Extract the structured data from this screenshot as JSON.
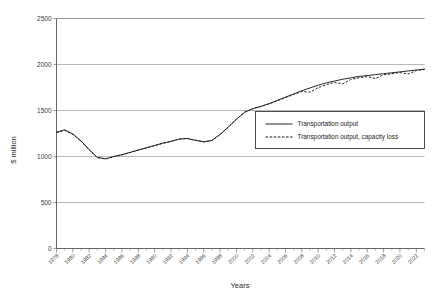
{
  "chart_data": {
    "type": "line",
    "title": "",
    "xlabel": "Years",
    "ylabel": "$ million",
    "ylim": [
      0,
      2500
    ],
    "xlim": [
      1978,
      2023
    ],
    "grid": true,
    "legend_position": "center-right",
    "y_ticks": [
      "0",
      "500",
      "1000",
      "1500",
      "2000",
      "2500"
    ],
    "y_tick_values": [
      0,
      500,
      1000,
      1500,
      2000,
      2500
    ],
    "x_tick_labels": [
      "1978",
      "1980",
      "1982",
      "1984",
      "1986",
      "1988",
      "1990",
      "1992",
      "1994",
      "1996",
      "1998",
      "2000",
      "2002",
      "2004",
      "2006",
      "2008",
      "2010",
      "2012",
      "2014",
      "2016",
      "2018",
      "2020",
      "2022"
    ],
    "x_tick_values": [
      1978,
      1980,
      1982,
      1984,
      1986,
      1988,
      1990,
      1992,
      1994,
      1996,
      1998,
      2000,
      2002,
      2004,
      2006,
      2008,
      2010,
      2012,
      2014,
      2016,
      2018,
      2020,
      2022
    ],
    "x": [
      1978,
      1979,
      1980,
      1981,
      1982,
      1983,
      1984,
      1985,
      1986,
      1987,
      1988,
      1989,
      1990,
      1991,
      1992,
      1993,
      1994,
      1995,
      1996,
      1997,
      1998,
      1999,
      2000,
      2001,
      2002,
      2003,
      2004,
      2005,
      2006,
      2007,
      2008,
      2009,
      2010,
      2011,
      2012,
      2013,
      2014,
      2015,
      2016,
      2017,
      2018,
      2019,
      2020,
      2021,
      2022,
      2023
    ],
    "series": [
      {
        "name": "Transportation output",
        "style": "solid",
        "values": [
          1265,
          1290,
          1245,
          1170,
          1075,
          990,
          975,
          1000,
          1020,
          1045,
          1070,
          1095,
          1120,
          1145,
          1165,
          1190,
          1195,
          1175,
          1160,
          1175,
          1240,
          1320,
          1405,
          1480,
          1520,
          1545,
          1575,
          1610,
          1645,
          1680,
          1715,
          1745,
          1775,
          1800,
          1820,
          1840,
          1855,
          1870,
          1880,
          1890,
          1900,
          1910,
          1920,
          1930,
          1940,
          1950
        ]
      },
      {
        "name": "Transportation output, capacity loss",
        "style": "dashed",
        "values": [
          1258,
          1284,
          1240,
          1166,
          1072,
          988,
          973,
          998,
          1018,
          1043,
          1068,
          1093,
          1118,
          1143,
          1163,
          1190,
          1197,
          1178,
          1158,
          1173,
          1238,
          1318,
          1404,
          1482,
          1520,
          1544,
          1572,
          1606,
          1640,
          1674,
          1706,
          1700,
          1748,
          1780,
          1805,
          1790,
          1838,
          1856,
          1868,
          1848,
          1888,
          1900,
          1912,
          1896,
          1934,
          1946
        ]
      }
    ]
  },
  "legend": {
    "items": [
      {
        "label": "Transportation output",
        "style": "solid"
      },
      {
        "label": "Transportation output, capacity loss",
        "style": "dashed"
      }
    ]
  },
  "axis": {
    "y_title": "$ million",
    "x_title": "Years"
  }
}
